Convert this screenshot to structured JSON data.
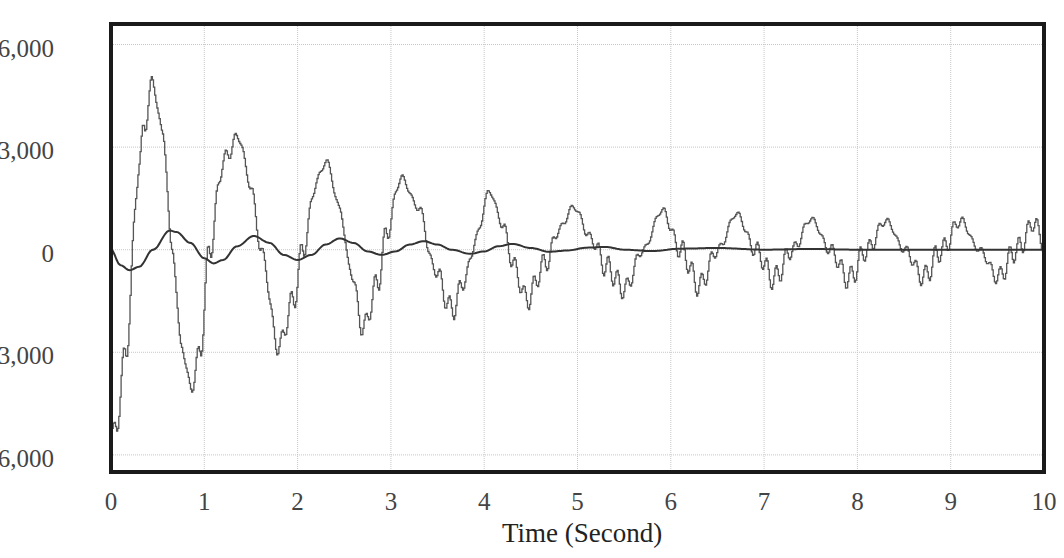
{
  "chart_data": {
    "type": "line",
    "title": "",
    "xlabel": "Time (Second)",
    "ylabel": "",
    "xlim": [
      0,
      10
    ],
    "ylim": [
      -6500,
      6600
    ],
    "x_ticks": [
      "0",
      "1",
      "2",
      "3",
      "4",
      "5",
      "6",
      "7",
      "8",
      "9",
      "10"
    ],
    "y_ticks": [
      {
        "value": 6000,
        "label": "6,000"
      },
      {
        "value": 3000,
        "label": "3,000"
      },
      {
        "value": 0,
        "label": "0"
      },
      {
        "value": -3000,
        "label": "-3,000"
      },
      {
        "value": -6000,
        "label": "-6,000"
      }
    ],
    "grid": true,
    "legend": null,
    "series": [
      {
        "name": "oscillating signal (noisy)",
        "color": "#555555",
        "ripple_amplitude": 350,
        "ripple_period": 0.1,
        "points": [
          [
            0.0,
            -5400
          ],
          [
            0.05,
            -5200
          ],
          [
            0.15,
            -3000
          ],
          [
            0.3,
            2500
          ],
          [
            0.35,
            3600
          ],
          [
            0.44,
            4900
          ],
          [
            0.55,
            3400
          ],
          [
            0.65,
            0
          ],
          [
            0.75,
            -2800
          ],
          [
            0.85,
            -4050
          ],
          [
            0.95,
            -3000
          ],
          [
            1.05,
            0
          ],
          [
            1.2,
            2600
          ],
          [
            1.36,
            3300
          ],
          [
            1.5,
            1800
          ],
          [
            1.6,
            0
          ],
          [
            1.79,
            -2850
          ],
          [
            1.95,
            -1500
          ],
          [
            2.05,
            0
          ],
          [
            2.2,
            2000
          ],
          [
            2.3,
            2600
          ],
          [
            2.45,
            1200
          ],
          [
            2.55,
            -500
          ],
          [
            2.7,
            -2300
          ],
          [
            2.85,
            -1000
          ],
          [
            2.95,
            500
          ],
          [
            3.1,
            2100
          ],
          [
            3.3,
            1200
          ],
          [
            3.45,
            -500
          ],
          [
            3.65,
            -1750
          ],
          [
            3.8,
            -800
          ],
          [
            3.9,
            300
          ],
          [
            4.05,
            1700
          ],
          [
            4.2,
            700
          ],
          [
            4.3,
            -400
          ],
          [
            4.45,
            -1450
          ],
          [
            4.65,
            -400
          ],
          [
            4.8,
            600
          ],
          [
            4.95,
            1250
          ],
          [
            5.15,
            300
          ],
          [
            5.3,
            -500
          ],
          [
            5.5,
            -1150
          ],
          [
            5.7,
            0
          ],
          [
            5.9,
            1150
          ],
          [
            6.1,
            0
          ],
          [
            6.3,
            -1050
          ],
          [
            6.5,
            0
          ],
          [
            6.7,
            1050
          ],
          [
            6.9,
            0
          ],
          [
            7.1,
            -850
          ],
          [
            7.3,
            0
          ],
          [
            7.5,
            900
          ],
          [
            7.7,
            0
          ],
          [
            7.9,
            -850
          ],
          [
            8.1,
            0
          ],
          [
            8.3,
            850
          ],
          [
            8.5,
            0
          ],
          [
            8.7,
            -800
          ],
          [
            8.9,
            0
          ],
          [
            9.1,
            850
          ],
          [
            9.3,
            0
          ],
          [
            9.5,
            -800
          ],
          [
            9.7,
            0
          ],
          [
            9.9,
            800
          ],
          [
            10.0,
            0
          ]
        ]
      },
      {
        "name": "damped sine (smooth)",
        "color": "#333333",
        "points": [
          [
            0.0,
            0
          ],
          [
            0.1,
            -450
          ],
          [
            0.2,
            -600
          ],
          [
            0.3,
            -500
          ],
          [
            0.45,
            0
          ],
          [
            0.63,
            560
          ],
          [
            0.7,
            520
          ],
          [
            0.85,
            200
          ],
          [
            1.0,
            -250
          ],
          [
            1.1,
            -400
          ],
          [
            1.2,
            -300
          ],
          [
            1.35,
            100
          ],
          [
            1.53,
            400
          ],
          [
            1.7,
            200
          ],
          [
            1.85,
            -150
          ],
          [
            2.0,
            -300
          ],
          [
            2.15,
            -150
          ],
          [
            2.3,
            150
          ],
          [
            2.45,
            330
          ],
          [
            2.6,
            200
          ],
          [
            2.75,
            -50
          ],
          [
            2.9,
            -150
          ],
          [
            3.05,
            -50
          ],
          [
            3.2,
            150
          ],
          [
            3.35,
            250
          ],
          [
            3.5,
            150
          ],
          [
            3.65,
            0
          ],
          [
            3.85,
            -120
          ],
          [
            4.0,
            -50
          ],
          [
            4.15,
            100
          ],
          [
            4.3,
            170
          ],
          [
            4.5,
            50
          ],
          [
            4.7,
            -60
          ],
          [
            4.9,
            -20
          ],
          [
            5.1,
            60
          ],
          [
            5.3,
            80
          ],
          [
            5.5,
            0
          ],
          [
            5.8,
            -40
          ],
          [
            6.1,
            30
          ],
          [
            6.5,
            50
          ],
          [
            7.0,
            0
          ],
          [
            7.5,
            20
          ],
          [
            8.0,
            0
          ],
          [
            9.0,
            0
          ],
          [
            10.0,
            0
          ]
        ]
      }
    ]
  },
  "plot_area": {
    "left": 111,
    "right": 1044,
    "top": 24,
    "bottom": 472
  }
}
